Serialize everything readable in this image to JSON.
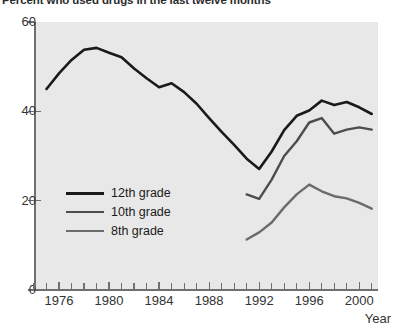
{
  "chart_data": {
    "type": "line",
    "title": "Percent who used drugs in the last twelve months",
    "xlabel": "Year",
    "ylabel": "",
    "xlim": [
      1974,
      2001.5
    ],
    "ylim": [
      0,
      60
    ],
    "grid": false,
    "legend_position": "inside-lower-left",
    "y_ticks": [
      0,
      20,
      40,
      60
    ],
    "y_tick_labels": [
      "0",
      "20",
      "40",
      "60"
    ],
    "x_ticks": [
      1974,
      1975,
      1976,
      1977,
      1978,
      1979,
      1980,
      1981,
      1982,
      1983,
      1984,
      1985,
      1986,
      1987,
      1988,
      1989,
      1990,
      1991,
      1992,
      1993,
      1994,
      1995,
      1996,
      1997,
      1998,
      1999,
      2000,
      2001
    ],
    "x_major_ticks": [
      1976,
      1980,
      1984,
      1988,
      1992,
      1996,
      2000
    ],
    "x_tick_labels": [
      "1976",
      "1980",
      "1984",
      "1988",
      "1992",
      "1996",
      "2000"
    ],
    "series": [
      {
        "name": "12th grade",
        "color": "#1a1a1a",
        "width": 2.6,
        "x": [
          1975,
          1976,
          1977,
          1978,
          1979,
          1980,
          1981,
          1982,
          1983,
          1984,
          1985,
          1986,
          1987,
          1988,
          1989,
          1990,
          1991,
          1992,
          1993,
          1994,
          1995,
          1996,
          1997,
          1998,
          1999,
          2000,
          2001
        ],
        "values": [
          45.0,
          48.5,
          51.5,
          53.8,
          54.2,
          53.1,
          52.1,
          49.6,
          47.4,
          45.4,
          46.3,
          44.3,
          41.7,
          38.5,
          35.4,
          32.5,
          29.4,
          27.1,
          31.0,
          35.8,
          39.0,
          40.2,
          42.4,
          41.4,
          42.1,
          40.9,
          39.4
        ]
      },
      {
        "name": "10th grade",
        "color": "#4d4d4d",
        "width": 2.4,
        "x": [
          1991,
          1992,
          1993,
          1994,
          1995,
          1996,
          1997,
          1998,
          1999,
          2000,
          2001
        ],
        "values": [
          21.4,
          20.4,
          24.7,
          30.0,
          33.3,
          37.5,
          38.5,
          35.0,
          35.9,
          36.4,
          35.9
        ]
      },
      {
        "name": "8th grade",
        "color": "#6b6b6b",
        "width": 2.4,
        "x": [
          1991,
          1992,
          1993,
          1994,
          1995,
          1996,
          1997,
          1998,
          1999,
          2000,
          2001
        ],
        "values": [
          11.3,
          12.9,
          15.1,
          18.5,
          21.4,
          23.6,
          22.1,
          21.0,
          20.5,
          19.5,
          18.2
        ]
      }
    ]
  },
  "legend": {
    "items": [
      {
        "label": "12th grade"
      },
      {
        "label": "10th grade"
      },
      {
        "label": "8th grade"
      }
    ]
  },
  "colors": {
    "plot_background": "#e8e8e8",
    "axis": "#6f6f6f",
    "text": "#333333"
  }
}
